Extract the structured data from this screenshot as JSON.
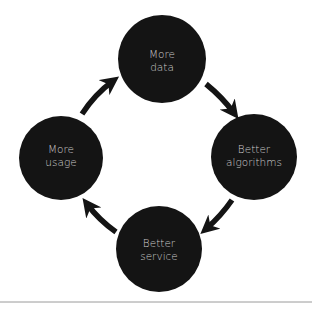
{
  "diagram": {
    "type": "cycle",
    "colors": {
      "background": "#ffffff",
      "node_fill": "#141414",
      "node_text": "#c9c9c9",
      "arrow": "#141414",
      "baseline": "#9a9a9a"
    },
    "nodes": [
      {
        "id": "more-data",
        "line1": "More",
        "line2": "data"
      },
      {
        "id": "better-algorithms",
        "line1": "Better",
        "line2": "algorithms"
      },
      {
        "id": "better-service",
        "line1": "Better",
        "line2": "service"
      },
      {
        "id": "more-usage",
        "line1": "More",
        "line2": "usage"
      }
    ],
    "edges": [
      {
        "from": "more-data",
        "to": "better-algorithms"
      },
      {
        "from": "better-algorithms",
        "to": "better-service"
      },
      {
        "from": "better-service",
        "to": "more-usage"
      },
      {
        "from": "more-usage",
        "to": "more-data"
      }
    ]
  }
}
